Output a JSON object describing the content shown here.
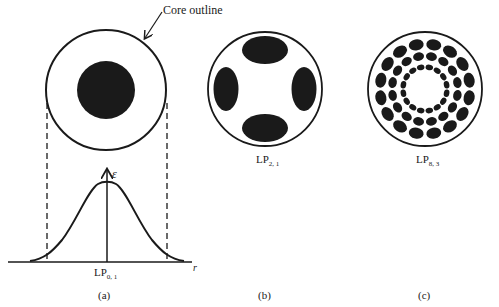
{
  "figure": {
    "annotation": "Core outline",
    "panels": [
      {
        "id": "a",
        "caption": "(a)",
        "mode_label": {
          "base": "LP",
          "sub": "0, 1"
        },
        "axis_y": "ε",
        "axis_x": "r"
      },
      {
        "id": "b",
        "caption": "(b)",
        "mode_label": {
          "base": "LP",
          "sub": "2, 1"
        }
      },
      {
        "id": "c",
        "caption": "(c)",
        "mode_label": {
          "base": "LP",
          "sub": "8, 3"
        }
      }
    ]
  },
  "colors": {
    "ink": "#1a1a1a",
    "background": "#ffffff"
  }
}
